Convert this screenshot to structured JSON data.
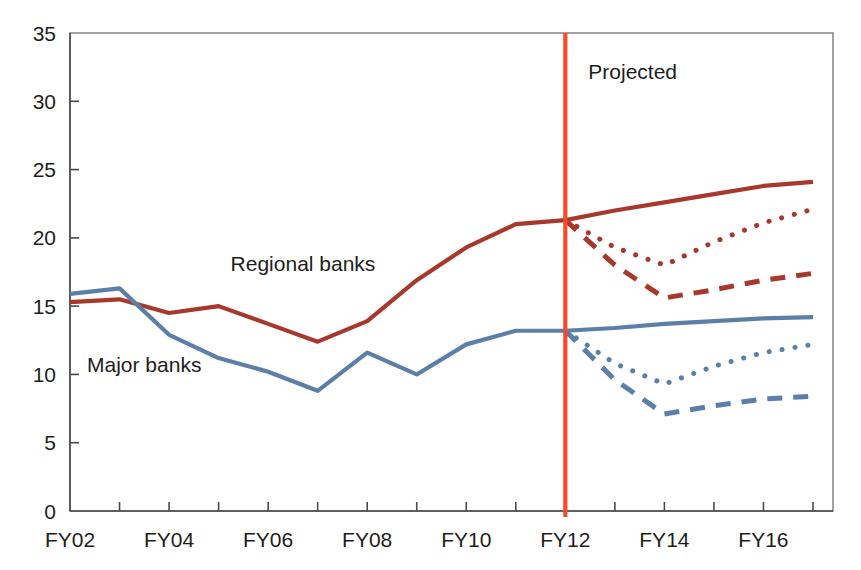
{
  "chart_data": {
    "type": "line",
    "title": "",
    "xlabel": "",
    "ylabel": "",
    "xlim": [
      "FY02",
      "FY17"
    ],
    "ylim": [
      0,
      35
    ],
    "ytick_values": [
      0,
      5,
      10,
      15,
      20,
      25,
      30,
      35
    ],
    "ytick_labels": [
      "0",
      "5",
      "10",
      "15",
      "20",
      "25",
      "30",
      "35"
    ],
    "x": [
      "FY02",
      "FY03",
      "FY04",
      "FY05",
      "FY06",
      "FY07",
      "FY08",
      "FY09",
      "FY10",
      "FY11",
      "FY12",
      "FY13",
      "FY14",
      "FY15",
      "FY16",
      "FY17"
    ],
    "xtick_labels": [
      "FY02",
      "",
      "FY04",
      "",
      "FY06",
      "",
      "FY08",
      "",
      "FY10",
      "",
      "FY12",
      "",
      "FY14",
      "",
      "FY16",
      ""
    ],
    "xtick_labels_shown": [
      "FY02",
      "FY04",
      "FY06",
      "FY08",
      "FY10",
      "FY12",
      "FY14",
      "FY16"
    ],
    "grid": false,
    "legend": "inline-annotations",
    "annotations": [
      {
        "text": "Regional banks",
        "x": "FY05",
        "y": 17.6
      },
      {
        "text": "Major banks",
        "x": "FY02",
        "y": 10.2
      },
      {
        "text": "Projected",
        "x": "FY12",
        "y": 31.6
      }
    ],
    "divider": {
      "label": "Projected",
      "x": "FY12",
      "color": "#F74A28"
    },
    "series": [
      {
        "name": "Regional banks",
        "color": "#A8382B",
        "style": "solid",
        "segment": "historical",
        "x": [
          "FY02",
          "FY03",
          "FY04",
          "FY05",
          "FY06",
          "FY07",
          "FY08",
          "FY09",
          "FY10",
          "FY11",
          "FY12"
        ],
        "values": [
          15.3,
          15.5,
          14.5,
          15.0,
          13.7,
          12.4,
          13.9,
          16.9,
          19.3,
          21.0,
          21.3
        ]
      },
      {
        "name": "Regional banks projection (baseline)",
        "color": "#A8382B",
        "style": "solid",
        "segment": "projected",
        "x": [
          "FY12",
          "FY13",
          "FY14",
          "FY15",
          "FY16",
          "FY17"
        ],
        "values": [
          21.3,
          22.0,
          22.6,
          23.2,
          23.8,
          24.1
        ]
      },
      {
        "name": "Regional banks projection (stress, dotted)",
        "color": "#A8382B",
        "style": "dotted",
        "segment": "projected",
        "x": [
          "FY12",
          "FY13",
          "FY14",
          "FY15",
          "FY16",
          "FY17"
        ],
        "values": [
          21.3,
          19.3,
          18.0,
          19.7,
          21.1,
          22.1
        ]
      },
      {
        "name": "Regional banks projection (severe stress, dashed)",
        "color": "#A8382B",
        "style": "dashed",
        "segment": "projected",
        "x": [
          "FY12",
          "FY13",
          "FY14",
          "FY15",
          "FY16",
          "FY17"
        ],
        "values": [
          21.3,
          18.0,
          15.6,
          16.2,
          16.9,
          17.4
        ]
      },
      {
        "name": "Major banks",
        "color": "#5B7FA8",
        "style": "solid",
        "segment": "historical",
        "x": [
          "FY02",
          "FY03",
          "FY04",
          "FY05",
          "FY06",
          "FY07",
          "FY08",
          "FY09",
          "FY10",
          "FY11",
          "FY12"
        ],
        "values": [
          15.9,
          16.3,
          12.9,
          11.2,
          10.2,
          8.8,
          11.6,
          10.0,
          12.2,
          13.2,
          13.2
        ]
      },
      {
        "name": "Major banks projection (baseline)",
        "color": "#5B7FA8",
        "style": "solid",
        "segment": "projected",
        "x": [
          "FY12",
          "FY13",
          "FY14",
          "FY15",
          "FY16",
          "FY17"
        ],
        "values": [
          13.2,
          13.4,
          13.7,
          13.9,
          14.1,
          14.2
        ]
      },
      {
        "name": "Major banks projection (stress, dotted)",
        "color": "#5B7FA8",
        "style": "dotted",
        "segment": "projected",
        "x": [
          "FY12",
          "FY13",
          "FY14",
          "FY15",
          "FY16",
          "FY17"
        ],
        "values": [
          13.2,
          10.8,
          9.3,
          10.6,
          11.6,
          12.2
        ]
      },
      {
        "name": "Major banks projection (severe stress, dashed)",
        "color": "#5B7FA8",
        "style": "dashed",
        "segment": "projected",
        "x": [
          "FY12",
          "FY13",
          "FY14",
          "FY15",
          "FY16",
          "FY17"
        ],
        "values": [
          13.2,
          9.6,
          7.1,
          7.7,
          8.2,
          8.4
        ]
      }
    ]
  },
  "labels": {
    "regional_banks": "Regional banks",
    "major_banks": "Major banks",
    "projected": "Projected"
  },
  "colors": {
    "regional": "#A8382B",
    "major": "#5B7FA8",
    "divider": "#F74A28",
    "axis": "#4a4a4a",
    "text": "#1d1d1b"
  }
}
